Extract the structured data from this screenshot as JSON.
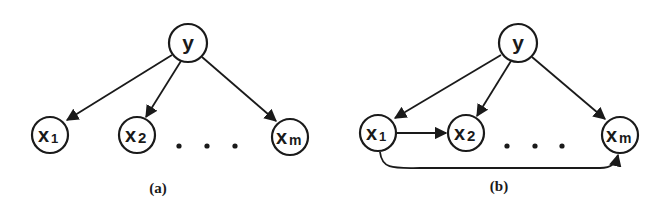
{
  "diagrams": [
    {
      "caption": "(a)",
      "nodes": {
        "y": {
          "label": "y",
          "sub": ""
        },
        "x1": {
          "label": "x",
          "sub": "1"
        },
        "x2": {
          "label": "x",
          "sub": "2"
        },
        "xm": {
          "label": "x",
          "sub": "m"
        }
      },
      "edges": [
        [
          "y",
          "x1"
        ],
        [
          "y",
          "x2"
        ],
        [
          "y",
          "xm"
        ]
      ],
      "ellipsis": "..."
    },
    {
      "caption": "(b)",
      "nodes": {
        "y": {
          "label": "y",
          "sub": ""
        },
        "x1": {
          "label": "x",
          "sub": "1"
        },
        "x2": {
          "label": "x",
          "sub": "2"
        },
        "xm": {
          "label": "x",
          "sub": "m"
        }
      },
      "edges": [
        [
          "y",
          "x1"
        ],
        [
          "y",
          "x2"
        ],
        [
          "y",
          "xm"
        ],
        [
          "x1",
          "x2"
        ],
        [
          "x1",
          "xm"
        ]
      ],
      "ellipsis": "..."
    }
  ],
  "colors": {
    "stroke": "#1a1a1a",
    "background": "#ffffff"
  }
}
